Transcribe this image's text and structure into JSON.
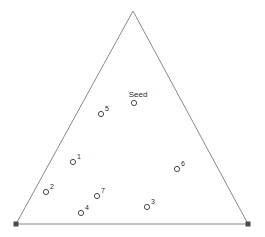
{
  "figure": {
    "name": "seed-point-triangle-diagram",
    "width": 265,
    "height": 237,
    "background_color": "#ffffff"
  },
  "chart_data": {
    "type": "scatter",
    "title": "",
    "subtitle": "",
    "xlabel": "",
    "ylabel": "",
    "grid": false,
    "legend": "none",
    "axis_visible": false,
    "xlim": [
      0,
      265
    ],
    "ylim": [
      237,
      0
    ],
    "boundary": {
      "name": "triangle",
      "shape": "triangle",
      "stroke_color": "#8a8a8a",
      "stroke_width": 1,
      "fill": "none",
      "vertices": [
        {
          "name": "apex",
          "x": 133,
          "y": 11,
          "marker": "none"
        },
        {
          "name": "bottom-right",
          "x": 248,
          "y": 224,
          "marker": "filled-square"
        },
        {
          "name": "bottom-left",
          "x": 16,
          "y": 224,
          "marker": "filled-square"
        }
      ]
    },
    "vertex_marker": {
      "shape": "square",
      "fill_color": "#4a4a4a",
      "size": 5
    },
    "point_marker": {
      "shape": "circle",
      "fill": "none",
      "stroke_color": "#4a4a4a",
      "stroke_width": 1,
      "radius": 2.6
    },
    "series": [
      {
        "name": "seed",
        "points": [
          {
            "label": "Seed",
            "x": 134,
            "y": 103,
            "label_x": 138,
            "label_y": 91,
            "label_style": "centered-above"
          }
        ]
      },
      {
        "name": "numbered-points",
        "points": [
          {
            "label": "1",
            "x": 73,
            "y": 162,
            "label_x": 77,
            "label_y": 153
          },
          {
            "label": "2",
            "x": 46,
            "y": 192,
            "label_x": 50,
            "label_y": 183
          },
          {
            "label": "3",
            "x": 147,
            "y": 207,
            "label_x": 151,
            "label_y": 198
          },
          {
            "label": "4",
            "x": 81,
            "y": 213,
            "label_x": 85,
            "label_y": 204
          },
          {
            "label": "5",
            "x": 101,
            "y": 114,
            "label_x": 105,
            "label_y": 105
          },
          {
            "label": "6",
            "x": 177,
            "y": 169,
            "label_x": 181,
            "label_y": 160
          },
          {
            "label": "7",
            "x": 97,
            "y": 196,
            "label_x": 101,
            "label_y": 187
          }
        ]
      }
    ]
  }
}
